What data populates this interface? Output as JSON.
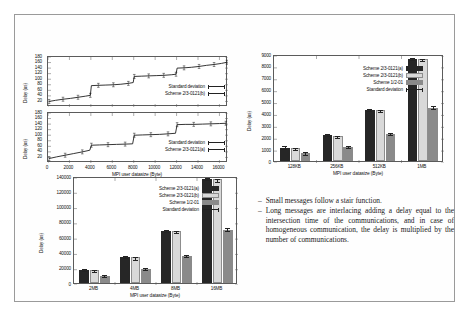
{
  "slide": {
    "bullets": [
      "Small messages follow a stair function.",
      "Long messages are interlacing adding a delay equal to the intersection time of the communications, and in case of homogeneous communication, the delay is multiplied by the number of communications."
    ],
    "bullet_marker": "–"
  },
  "colors": {
    "scheme_a": "#262626",
    "scheme_b": "#d9d9d9",
    "scheme_c": "#8a8a8a",
    "axis": "#5b5b5b",
    "text": "#111111"
  },
  "legend_labels": {
    "scheme_a": "Scheme 2/3-0121(a)",
    "scheme_b": "Scheme 2/3-0121(b)",
    "scheme_c": "Scheme 1/2-01",
    "stddev": "Standard deviation"
  },
  "chart_data": [
    {
      "id": "top-left-upper",
      "type": "line",
      "title": "",
      "xlabel": "",
      "ylabel": "Delay (us)",
      "xlim": [
        0,
        16800
      ],
      "ylim": [
        0,
        180
      ],
      "xticks": [
        0,
        2000,
        4000,
        6000,
        8000,
        10000,
        12000,
        14000,
        16000
      ],
      "yticks": [
        20,
        40,
        60,
        80,
        100,
        120,
        140,
        160,
        180
      ],
      "ytick_labels": [
        "20",
        "40",
        "60",
        "80",
        "100",
        "120",
        "140",
        "160",
        "180"
      ],
      "grid": false,
      "legend_position": "bottom-right",
      "legend": [
        "Standard deviation",
        "Scheme 2/3-0121(b)"
      ],
      "series": [
        {
          "name": "Scheme 2/3-0121(b)",
          "x": [
            100,
            700,
            1400,
            2100,
            2800,
            3500,
            3950,
            4050,
            4700,
            5400,
            6100,
            6800,
            7500,
            7950,
            8050,
            8700,
            9400,
            10100,
            10800,
            11500,
            11950,
            12050,
            12700,
            13400,
            14100,
            14800,
            15500,
            16200,
            16700
          ],
          "y": [
            20,
            24,
            28,
            31,
            35,
            39,
            42,
            77,
            78,
            79,
            80,
            82,
            85,
            88,
            110,
            111,
            112,
            113,
            114,
            116,
            118,
            140,
            141,
            143,
            146,
            150,
            153,
            157,
            161
          ]
        }
      ]
    },
    {
      "id": "top-left-lower",
      "type": "line",
      "title": "",
      "xlabel": "MPI user datasize (Byte)",
      "ylabel": "Delay (us)",
      "xlim": [
        0,
        16800
      ],
      "ylim": [
        0,
        180
      ],
      "xticks": [
        0,
        2000,
        4000,
        6000,
        8000,
        10000,
        12000,
        14000,
        16000
      ],
      "xtick_labels": [
        "0",
        "2000",
        "4000",
        "6000",
        "8000",
        "10000",
        "12000",
        "14000",
        "16000"
      ],
      "yticks": [
        20,
        40,
        60,
        80,
        100,
        120,
        140,
        160,
        180
      ],
      "ytick_labels": [
        "20",
        "40",
        "60",
        "80",
        "100",
        "120",
        "140",
        "160",
        "180"
      ],
      "grid": false,
      "legend_position": "bottom-right",
      "legend": [
        "Standard deviation",
        "Scheme 2/3-0121(a)"
      ],
      "series": [
        {
          "name": "Scheme 2/3-0121(a)",
          "x": [
            100,
            800,
            1600,
            2400,
            3200,
            3900,
            4050,
            4800,
            5600,
            6400,
            7200,
            7900,
            8050,
            8800,
            9600,
            10400,
            11200,
            11900,
            12050,
            12800,
            13600,
            14400,
            15200,
            16000,
            16600
          ],
          "y": [
            16,
            22,
            28,
            34,
            40,
            46,
            64,
            65,
            66,
            67,
            68,
            69,
            100,
            101,
            102,
            103,
            105,
            107,
            138,
            139,
            139,
            140,
            141,
            142,
            143
          ]
        }
      ]
    },
    {
      "id": "right-bar",
      "type": "bar",
      "title": "",
      "xlabel": "MPI user datasize (Byte)",
      "ylabel": "Delay (us)",
      "categories": [
        "128KB",
        "256KB",
        "512KB",
        "1MB"
      ],
      "ylim": [
        0,
        9000
      ],
      "yticks": [
        0,
        1000,
        2000,
        3000,
        4000,
        5000,
        6000,
        7000,
        8000,
        9000
      ],
      "ytick_labels": [
        "0",
        "1000",
        "2000",
        "3000",
        "4000",
        "5000",
        "6000",
        "7000",
        "8000",
        "9000"
      ],
      "grid": false,
      "legend_position": "top-center",
      "series": [
        {
          "name": "Scheme 2/3-0121(a)",
          "values": [
            1130,
            2180,
            4300,
            8560
          ],
          "errors": [
            40,
            40,
            60,
            60
          ]
        },
        {
          "name": "Scheme 2/3-0121(b)",
          "values": [
            1100,
            2130,
            4300,
            8560
          ],
          "errors": [
            90,
            60,
            110,
            90
          ]
        },
        {
          "name": "Scheme 1/2-01",
          "values": [
            640,
            1170,
            2290,
            4500
          ],
          "errors": [
            30,
            30,
            40,
            40
          ]
        }
      ]
    },
    {
      "id": "bottom-bar",
      "type": "bar",
      "title": "",
      "xlabel": "MPI user datasize (Byte)",
      "ylabel": "Delay (us)",
      "categories": [
        "2MB",
        "4MB",
        "8MB",
        "16MB"
      ],
      "ylim": [
        0,
        140000
      ],
      "yticks": [
        0,
        20000,
        40000,
        60000,
        80000,
        100000,
        120000,
        140000
      ],
      "ytick_labels": [
        "0",
        "20000",
        "40000",
        "60000",
        "80000",
        "100000",
        "120000",
        "140000"
      ],
      "grid": false,
      "legend_position": "top-center",
      "series": [
        {
          "name": "Scheme 2/3-0121(a)",
          "values": [
            17200,
            34200,
            68200,
            136500
          ],
          "errors": [
            600,
            700,
            900,
            1200
          ]
        },
        {
          "name": "Scheme 2/3-0121(b)",
          "values": [
            16500,
            33500,
            67800,
            135500
          ],
          "errors": [
            1400,
            1300,
            1100,
            2200
          ]
        },
        {
          "name": "Scheme 1/2-01",
          "values": [
            9200,
            18000,
            35200,
            70000
          ],
          "errors": [
            400,
            500,
            600,
            900
          ]
        }
      ]
    }
  ]
}
